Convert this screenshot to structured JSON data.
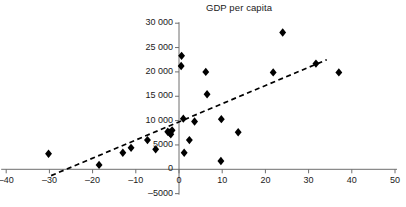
{
  "chart_data": {
    "type": "scatter",
    "title": "GDP per capita",
    "xlabel": "",
    "ylabel": "",
    "xlim": [
      -40,
      50
    ],
    "ylim": [
      -5000,
      30000
    ],
    "grid": false,
    "legend": null,
    "x_ticks": [
      -40,
      -30,
      -20,
      -10,
      0,
      10,
      20,
      30,
      40,
      50
    ],
    "x_tick_labels": [
      "–40",
      "–30",
      "–20",
      "–10",
      "0",
      "10",
      "20",
      "30",
      "40",
      "50"
    ],
    "y_ticks": [
      -5000,
      0,
      5000,
      10000,
      15000,
      20000,
      25000,
      30000
    ],
    "y_tick_labels": [
      "–5000",
      "0",
      "5000",
      "10 000",
      "15 000",
      "20 000",
      "25 000",
      "30 000"
    ],
    "marker": "diamond",
    "marker_color": "#000000",
    "points": [
      {
        "x": -30.2,
        "y": 3200
      },
      {
        "x": -18.5,
        "y": 900
      },
      {
        "x": -13.0,
        "y": 3400
      },
      {
        "x": -11.1,
        "y": 4400
      },
      {
        "x": -7.3,
        "y": 6000
      },
      {
        "x": -5.4,
        "y": 4100
      },
      {
        "x": -2.6,
        "y": 7700
      },
      {
        "x": -2.2,
        "y": 7500
      },
      {
        "x": -1.9,
        "y": 7200
      },
      {
        "x": -1.6,
        "y": 8000
      },
      {
        "x": 0.6,
        "y": 23300
      },
      {
        "x": 0.5,
        "y": 21200
      },
      {
        "x": 1.0,
        "y": 10400
      },
      {
        "x": 1.2,
        "y": 3400
      },
      {
        "x": 2.4,
        "y": 6000
      },
      {
        "x": 3.6,
        "y": 9800
      },
      {
        "x": 6.2,
        "y": 20000
      },
      {
        "x": 6.5,
        "y": 15400
      },
      {
        "x": 9.8,
        "y": 10300
      },
      {
        "x": 9.7,
        "y": 1700
      },
      {
        "x": 13.7,
        "y": 7600
      },
      {
        "x": 21.8,
        "y": 19900
      },
      {
        "x": 24.0,
        "y": 28100
      },
      {
        "x": 31.7,
        "y": 21700
      },
      {
        "x": 37.0,
        "y": 19900
      }
    ],
    "trendline": {
      "style": "dashed",
      "color": "#000000",
      "x_start": -29.6,
      "y_start": -1300,
      "x_end": 34.2,
      "y_end": 22500
    }
  }
}
